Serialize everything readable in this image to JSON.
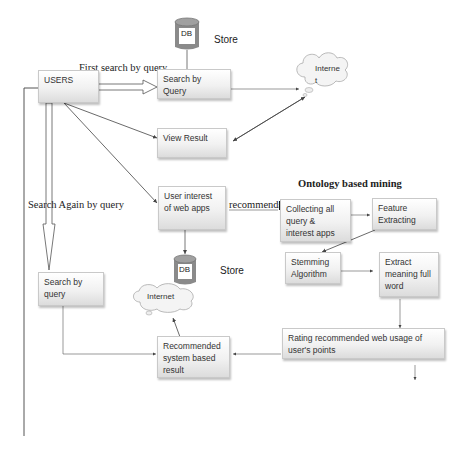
{
  "diagram": {
    "title": "Ontology based mining",
    "labels": {
      "first_search": "First search by query",
      "search_again": "Search Again by query",
      "recommends": "recommends",
      "store_top": "Store",
      "store_mid": "Store"
    },
    "db": {
      "top": "DB",
      "mid": "DB"
    },
    "clouds": {
      "internet_top_line1": "Interne",
      "internet_top_line2": "t",
      "internet_bottom": "Internet"
    },
    "nodes": {
      "users": "USERS",
      "search_by_query": "Search by Query",
      "view_result": "View Result",
      "user_interest": "User interest of web apps",
      "collecting": "Collecting all query & interest apps",
      "feature": "Feature Extracting",
      "stemming": "Stemming Algorithm",
      "extract": "Extract meaning full word",
      "search_by_query_2": "Search by query",
      "recommended": "Recommended system based result",
      "rating": "Rating recommended web usage of user's points"
    },
    "colors": {
      "line": "#444444",
      "box_border": "#c9c9c9",
      "db_fill": "#8a8a8a"
    }
  }
}
